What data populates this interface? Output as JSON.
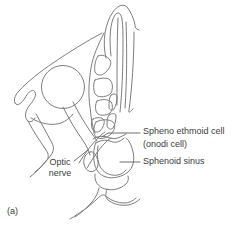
{
  "figure": {
    "panel_label": "(a)",
    "labels": {
      "spheno_ethmoid_line1": "Spheno ethmoid cell",
      "spheno_ethmoid_line2": "(onodi cell)",
      "sphenoid_sinus": "Sphenoid sinus",
      "optic_nerve_line1": "Optic",
      "optic_nerve_line2": "nerve"
    },
    "colors": {
      "line": "#7d7d7d",
      "leader": "#5f5f5f",
      "text": "#3c3c3c",
      "background": "#ffffff"
    }
  }
}
